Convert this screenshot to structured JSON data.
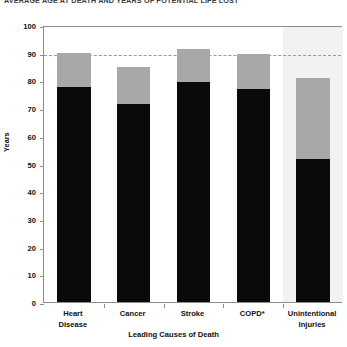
{
  "chart_data": {
    "type": "bar",
    "subtype": "stacked",
    "title": "AVERAGE AGE AT DEATH AND YEARS OF POTENTIAL LIFE LOST",
    "xlabel": "Leading Causes of Death",
    "ylabel": "Years",
    "ylim": [
      0,
      100
    ],
    "ytick_step": 10,
    "yticks": [
      0,
      10,
      20,
      30,
      40,
      50,
      60,
      70,
      80,
      90,
      100
    ],
    "grid": false,
    "legend_position": "none",
    "categories": [
      "Heart Disease",
      "Cancer",
      "Stroke",
      "COPD*",
      "Unintentional Injuries"
    ],
    "series": [
      {
        "name": "Average age at death",
        "color": "#0a0a0a",
        "values": [
          77.5,
          71.5,
          79.5,
          77,
          51.5
        ]
      },
      {
        "name": "Years of potential life lost",
        "color": "#a8a8a8",
        "values": [
          12.5,
          13.5,
          12,
          12.5,
          29.5
        ]
      }
    ],
    "totals": [
      90,
      85,
      91.5,
      89.5,
      81
    ],
    "annotations": [
      {
        "type": "reference_line",
        "orientation": "horizontal",
        "value": 90,
        "style": "dashed",
        "color": "#9a9a9a"
      },
      {
        "type": "highlight_band",
        "category": "Unintentional Injuries",
        "color": "#f2f2f2"
      }
    ],
    "footnote_marker": "*"
  },
  "colors": {
    "bar_lower": "#0a0a0a",
    "bar_upper": "#a8a8a8",
    "axis": "#8c8c8c",
    "reference_line": "#9a9a9a",
    "highlight": "#f2f2f2",
    "text": "#111111"
  }
}
